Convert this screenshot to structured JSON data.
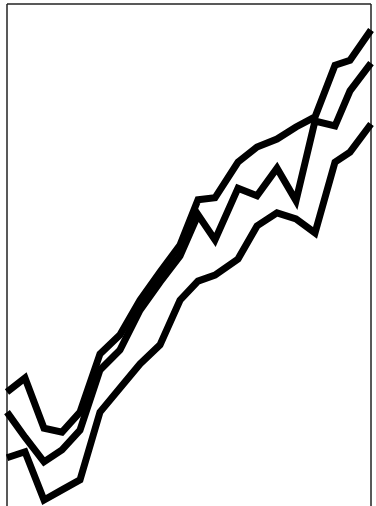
{
  "chart_data": {
    "type": "line",
    "title": "",
    "xlabel": "",
    "ylabel": "",
    "grid": false,
    "legend": "none",
    "frame": {
      "left": 7,
      "top": 4,
      "right": 371,
      "bottom_visible": false
    },
    "line_color": "#000000",
    "background": "#ffffff",
    "line_width": 7,
    "ylim": [
      0,
      100
    ],
    "x": [
      0,
      1,
      2,
      3,
      4,
      5,
      6,
      7,
      8,
      9,
      10,
      11,
      12,
      13,
      14,
      15,
      16,
      17,
      18,
      19
    ],
    "series": [
      {
        "name": "series-top",
        "values": [
          22.7,
          25.5,
          15.5,
          14.7,
          18.7,
          30.3,
          34.1,
          41.0,
          46.6,
          52.0,
          61.0,
          61.4,
          68.5,
          71.5,
          73.1,
          75.5,
          77.5,
          87.8,
          88.8,
          94.8
        ]
      },
      {
        "name": "series-middle",
        "values": [
          18.7,
          13.7,
          8.8,
          11.2,
          15.1,
          27.1,
          31.1,
          39.0,
          44.6,
          49.8,
          58.0,
          53.0,
          63.3,
          61.8,
          67.3,
          60.8,
          76.7,
          75.7,
          82.7,
          88.2
        ]
      },
      {
        "name": "series-bottom",
        "values": [
          9.6,
          10.8,
          1.2,
          3.2,
          5.2,
          18.7,
          23.5,
          28.3,
          32.1,
          41.0,
          44.8,
          46.0,
          49.2,
          55.8,
          58.4,
          57.2,
          54.4,
          68.5,
          70.5,
          76.1
        ]
      }
    ]
  }
}
